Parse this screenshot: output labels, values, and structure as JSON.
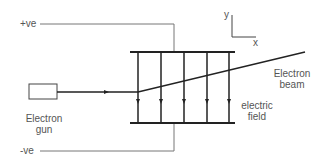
{
  "diagram": {
    "type": "electron deflection in electric field",
    "labels": {
      "positive_terminal": "+ve",
      "negative_terminal": "-ve",
      "electron_gun_line1": "Electron",
      "electron_gun_line2": "gun",
      "electron_beam_line1": "Electron",
      "electron_beam_line2": "beam",
      "electric_field_line1": "electric",
      "electric_field_line2": "field",
      "axis_y": "y",
      "axis_x": "x"
    },
    "components": [
      {
        "name": "positive-plate",
        "description": "upper horizontal plate connected to +ve"
      },
      {
        "name": "negative-plate",
        "description": "lower horizontal plate connected to -ve"
      },
      {
        "name": "electron-gun",
        "description": "rectangle emitting beam to the right"
      },
      {
        "name": "field-lines",
        "count": 5,
        "direction": "downward (from + to -)"
      },
      {
        "name": "electron-beam",
        "description": "straight horizontal then deflected upward between plates"
      }
    ],
    "colors": {
      "line": "#222222",
      "wire": "#777777",
      "text": "#555555",
      "background": "#ffffff"
    }
  }
}
